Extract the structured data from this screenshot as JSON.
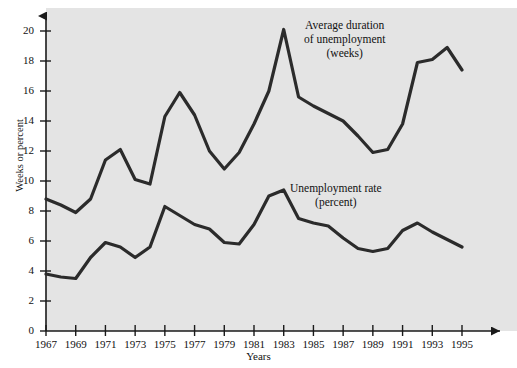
{
  "chart_data": {
    "type": "line",
    "title": "",
    "xlabel": "Years",
    "ylabel": "Weeks or percent",
    "xlim": [
      1967,
      1995
    ],
    "ylim": [
      0,
      21
    ],
    "grid": false,
    "legend_position": "inline-annotation",
    "x": [
      1967,
      1968,
      1969,
      1970,
      1971,
      1972,
      1973,
      1974,
      1975,
      1976,
      1977,
      1978,
      1979,
      1980,
      1981,
      1982,
      1983,
      1984,
      1985,
      1986,
      1987,
      1988,
      1989,
      1990,
      1991,
      1992,
      1993,
      1994,
      1995
    ],
    "y_ticks": [
      0,
      2,
      4,
      6,
      8,
      10,
      12,
      14,
      16,
      18,
      20
    ],
    "x_ticks": [
      1967,
      1969,
      1971,
      1973,
      1975,
      1977,
      1979,
      1981,
      1983,
      1985,
      1987,
      1989,
      1991,
      1993,
      1995
    ],
    "series": [
      {
        "name": "Average duration of unemployment (weeks)",
        "values": [
          8.8,
          8.4,
          7.9,
          8.8,
          11.4,
          12.1,
          10.1,
          9.8,
          14.3,
          15.9,
          14.4,
          12.0,
          10.8,
          11.9,
          13.8,
          16.0,
          20.1,
          15.6,
          15.0,
          14.5,
          14.0,
          13.0,
          11.9,
          12.1,
          13.8,
          17.9,
          18.1,
          18.9,
          17.4
        ]
      },
      {
        "name": "Unemployment rate (percent)",
        "values": [
          3.8,
          3.6,
          3.5,
          4.9,
          5.9,
          5.6,
          4.9,
          5.6,
          8.3,
          7.7,
          7.1,
          6.8,
          5.9,
          5.8,
          7.1,
          9.0,
          9.4,
          7.5,
          7.2,
          7.0,
          6.2,
          5.5,
          5.3,
          5.5,
          6.7,
          7.2,
          6.6,
          6.1,
          5.6
        ]
      }
    ]
  },
  "annotations": {
    "duration": [
      "Average duration",
      "of unemployment",
      "(weeks)"
    ],
    "rate": [
      "Unemployment rate",
      "(percent)"
    ]
  },
  "style": {
    "plot_background": "#e4e4e4",
    "line_color": "#2b2b2b",
    "axis_color": "#1a1a1a",
    "text_color": "#111111"
  }
}
